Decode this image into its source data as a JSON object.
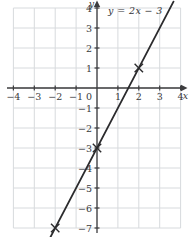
{
  "chart_data": {
    "type": "line",
    "title": "",
    "equation_label": "y = 2x − 3",
    "x_axis_label": "x",
    "y_axis_label": "y",
    "x_range": [
      -4,
      4
    ],
    "y_range": [
      -7,
      4
    ],
    "x_ticks": [
      -4,
      -3,
      -2,
      -1,
      0,
      1,
      2,
      3,
      4
    ],
    "y_ticks": [
      4,
      3,
      2,
      1,
      -1,
      -2,
      -3,
      -4,
      -5,
      -6,
      -7
    ],
    "origin_label": "0",
    "grid": true,
    "series": [
      {
        "name": "y = 2x − 3",
        "slope": 2,
        "intercept": -3,
        "x_start": -2.24,
        "x_end": 3.66
      }
    ],
    "marked_points": [
      {
        "x": -2,
        "y": -7
      },
      {
        "x": 0,
        "y": -3
      },
      {
        "x": 2,
        "y": 1
      }
    ],
    "colors": {
      "background": "#ffffff",
      "grid": "#d7dadd",
      "axis": "#3c3c3e",
      "line": "#2b2b2d",
      "labels": "#3a3a3c"
    }
  }
}
